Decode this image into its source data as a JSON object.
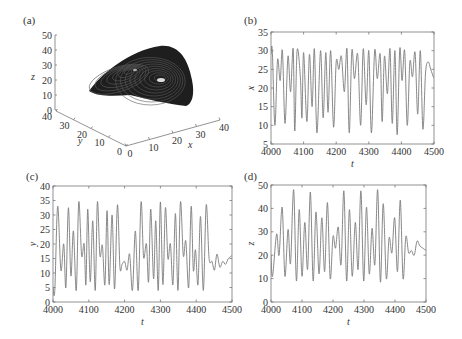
{
  "figure": {
    "panels": [
      {
        "id": "a",
        "label": "(a)"
      },
      {
        "id": "b",
        "label": "(b)"
      },
      {
        "id": "c",
        "label": "(c)"
      },
      {
        "id": "d",
        "label": "(d)"
      }
    ]
  },
  "chart_data": [
    {
      "panel": "(a)",
      "type": "scatter",
      "title": "3D phase portrait (strange attractor)",
      "xlabel": "x",
      "ylabel": "y",
      "zlabel": "z",
      "x_ticks": [
        "0",
        "10",
        "20",
        "30",
        "40"
      ],
      "y_ticks": [
        "0",
        "10",
        "20",
        "30",
        "40"
      ],
      "z_ticks": [
        "0",
        "10",
        "20",
        "30",
        "40",
        "50"
      ],
      "xlim": [
        0,
        40
      ],
      "ylim": [
        0,
        40
      ],
      "zlim": [
        0,
        50
      ],
      "grid": false
    },
    {
      "panel": "(b)",
      "type": "line",
      "xlabel": "t",
      "ylabel": "x",
      "xlim": [
        4000,
        4500
      ],
      "ylim": [
        5,
        35
      ],
      "x_ticks": [
        "4000",
        "4100",
        "4200",
        "4300",
        "4400",
        "4500"
      ],
      "y_ticks": [
        "5",
        "10",
        "15",
        "20",
        "25",
        "30",
        "35"
      ],
      "grid": false,
      "x": [
        4000,
        4004,
        4012,
        4020,
        4028,
        4035,
        4043,
        4052,
        4060,
        4068,
        4073,
        4080,
        4090,
        4095,
        4100,
        4110,
        4118,
        4126,
        4133,
        4141,
        4152,
        4160,
        4168,
        4175,
        4183,
        4192,
        4200,
        4208,
        4216,
        4225,
        4233,
        4240,
        4248,
        4256,
        4266,
        4275,
        4283,
        4292,
        4300,
        4308,
        4318,
        4326,
        4335,
        4341,
        4348,
        4357,
        4365,
        4372,
        4380,
        4387,
        4395,
        4402,
        4410,
        4418,
        4426,
        4434,
        4442,
        4450,
        4458,
        4466,
        4474,
        4482,
        4490,
        4498,
        4500
      ],
      "values": [
        29,
        30,
        10,
        27.5,
        22,
        30,
        10.5,
        28.5,
        19,
        30.5,
        8.5,
        30,
        23,
        12,
        29.5,
        11,
        29,
        15,
        30.5,
        8,
        30,
        12,
        29.5,
        13.5,
        30,
        9.5,
        27,
        25,
        28.5,
        19,
        30.5,
        8,
        30,
        22.5,
        29,
        10,
        30.5,
        15.5,
        30,
        8,
        30,
        22.5,
        29,
        11,
        28.5,
        18.5,
        30.5,
        10.5,
        30,
        7.5,
        30.5,
        22,
        30,
        10,
        27,
        23,
        29.5,
        13,
        30,
        9,
        24,
        27,
        25,
        23,
        23
      ]
    },
    {
      "panel": "(c)",
      "type": "line",
      "xlabel": "t",
      "ylabel": "y",
      "xlim": [
        4000,
        4500
      ],
      "ylim": [
        0,
        40
      ],
      "x_ticks": [
        "4000",
        "4100",
        "4200",
        "4300",
        "4400",
        "4500"
      ],
      "y_ticks": [
        "0",
        "5",
        "10",
        "15",
        "20",
        "25",
        "30",
        "35",
        "40"
      ],
      "grid": false,
      "x": [
        4000,
        4005,
        4013,
        4022,
        4030,
        4036,
        4043,
        4050,
        4057,
        4065,
        4072,
        4080,
        4087,
        4092,
        4097,
        4104,
        4111,
        4118,
        4124,
        4131,
        4138,
        4145,
        4151,
        4157,
        4165,
        4172,
        4180,
        4187,
        4193,
        4200,
        4207,
        4214,
        4222,
        4230,
        4238,
        4246,
        4253,
        4261,
        4267,
        4273,
        4281,
        4287,
        4294,
        4300,
        4307,
        4314,
        4321,
        4328,
        4335,
        4342,
        4349,
        4356,
        4364,
        4371,
        4379,
        4386,
        4392,
        4398,
        4405,
        4412,
        4420,
        4428,
        4436,
        4444,
        4451,
        4458,
        4466,
        4474,
        4482,
        4490,
        4500
      ],
      "values": [
        5,
        4,
        33,
        11,
        20,
        5,
        32.5,
        9,
        24.5,
        4,
        34.5,
        16,
        20,
        6,
        32,
        7,
        28,
        4,
        34.5,
        16,
        19.5,
        6,
        31.5,
        6,
        30,
        4.5,
        33.5,
        12,
        13,
        14,
        11,
        16.5,
        4,
        24.5,
        4,
        34.5,
        15.5,
        20,
        7,
        32,
        8,
        28,
        4,
        34.5,
        6,
        32.5,
        15,
        20,
        6,
        30.5,
        4,
        34.5,
        16,
        21,
        5,
        33,
        11,
        18,
        6,
        29.5,
        4,
        33.5,
        15,
        14,
        11,
        16.5,
        12,
        14,
        13,
        15,
        16
      ]
    },
    {
      "panel": "(d)",
      "type": "line",
      "xlabel": "t",
      "ylabel": "z",
      "xlim": [
        4000,
        4500
      ],
      "ylim": [
        0,
        50
      ],
      "x_ticks": [
        "4000",
        "4100",
        "4200",
        "4300",
        "4400",
        "4500"
      ],
      "y_ticks": [
        "0",
        "10",
        "20",
        "30",
        "40",
        "50"
      ],
      "grid": false,
      "x": [
        4000,
        4005,
        4018,
        4026,
        4036,
        4045,
        4055,
        4063,
        4073,
        4082,
        4091,
        4100,
        4109,
        4118,
        4127,
        4136,
        4145,
        4155,
        4164,
        4173,
        4182,
        4191,
        4200,
        4208,
        4217,
        4226,
        4235,
        4244,
        4253,
        4262,
        4272,
        4281,
        4290,
        4299,
        4308,
        4317,
        4326,
        4335,
        4344,
        4353,
        4362,
        4372,
        4381,
        4390,
        4399,
        4408,
        4417,
        4426,
        4435,
        4444,
        4453,
        4462,
        4471,
        4480,
        4490,
        4500
      ],
      "values": [
        20,
        11,
        29,
        20,
        40.5,
        11,
        31,
        16.5,
        48,
        9,
        39.5,
        11,
        34,
        14,
        47,
        9,
        38.5,
        12,
        36,
        13,
        42.5,
        10,
        28,
        23,
        32,
        16,
        47.5,
        9,
        39.5,
        11,
        34,
        14,
        47.5,
        9,
        40.5,
        12,
        31.5,
        16,
        48,
        8.5,
        42,
        10,
        27.5,
        21,
        36,
        13,
        43.5,
        10,
        28,
        21,
        22,
        20,
        26,
        24,
        23,
        22
      ]
    }
  ]
}
